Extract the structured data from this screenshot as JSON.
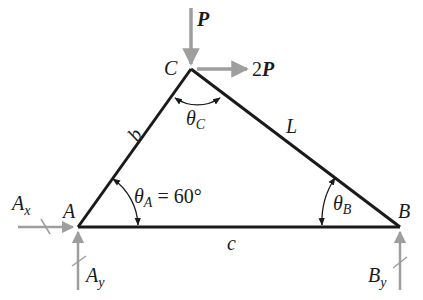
{
  "diagram": {
    "type": "free-body diagram (triangle truss)",
    "colors": {
      "member": "#1a1a1a",
      "force_arrow": "#9e9e9e",
      "text": "#1a1a1a"
    },
    "vertices": {
      "A": {
        "label": "A"
      },
      "B": {
        "label": "B"
      },
      "C": {
        "label": "C"
      }
    },
    "sides": {
      "b": {
        "label": "b",
        "between": "A-C"
      },
      "L": {
        "label": "L",
        "between": "C-B"
      },
      "c": {
        "label": "c",
        "between": "A-B"
      }
    },
    "angles": {
      "theta_A": {
        "symbol": "θ",
        "subscript": "A",
        "value": " = 60°"
      },
      "theta_B": {
        "symbol": "θ",
        "subscript": "B"
      },
      "theta_C": {
        "symbol": "θ",
        "subscript": "C"
      }
    },
    "loads": {
      "P": {
        "label": "P",
        "direction": "down",
        "at": "C"
      },
      "twoP": {
        "label": "2P",
        "direction": "right",
        "at": "C"
      }
    },
    "reactions": {
      "Ax": {
        "label": "A",
        "subscript": "x",
        "direction": "right",
        "at": "A"
      },
      "Ay": {
        "label": "A",
        "subscript": "y",
        "direction": "up",
        "at": "A"
      },
      "By": {
        "label": "B",
        "subscript": "y",
        "direction": "up",
        "at": "B"
      }
    }
  }
}
